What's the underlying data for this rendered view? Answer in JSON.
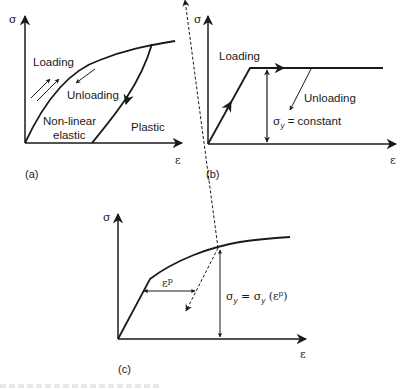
{
  "figure": {
    "panels": [
      {
        "id": "a",
        "caption": "(a)",
        "y_axis": "σ",
        "x_axis": "ε",
        "labels": [
          "Loading",
          "Unloading",
          "Non-linear",
          "elastic",
          "Plastic"
        ]
      },
      {
        "id": "b",
        "caption": "(b)",
        "y_axis": "σ",
        "x_axis": "ε",
        "labels": [
          "Loading",
          "Unloading"
        ],
        "yield_label": {
          "sym": "σ",
          "sub": "y",
          "rest": " = constant"
        }
      },
      {
        "id": "c",
        "caption": "(c)",
        "y_axis": "σ",
        "x_axis": "ε",
        "plastic_strain": {
          "base": "ε",
          "sup": "p"
        },
        "yield_label": {
          "sym": "σ",
          "sub": "y",
          "mid": " = σ",
          "sub2": "y",
          "paren_open": " (ε",
          "sup": "p",
          "paren_close": ")"
        }
      }
    ],
    "colors": {
      "ink": "#1a1a1a",
      "background": "#ffffff"
    }
  }
}
